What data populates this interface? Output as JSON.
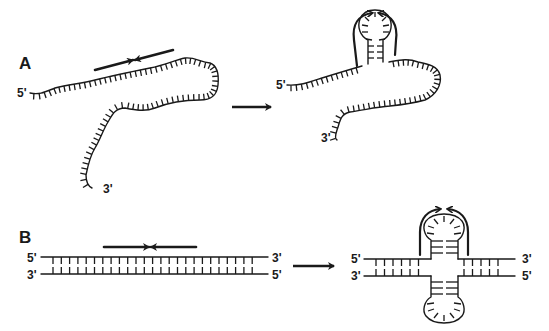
{
  "figure": {
    "panels": [
      {
        "id": "A",
        "label": "A",
        "description": "Single-stranded DNA forms a hairpin (stem-loop) where an inverted repeat is present",
        "before": {
          "end_5": "5'",
          "end_3": "3'",
          "inverted_repeat_arrows": "→←"
        },
        "after": {
          "end_5": "5'",
          "end_3": "3'",
          "structure": "hairpin"
        }
      },
      {
        "id": "B",
        "label": "B",
        "description": "Double-stranded DNA with an inverted repeat forms a cruciform structure",
        "before": {
          "top_left": "5'",
          "top_right": "3'",
          "bottom_left": "3'",
          "bottom_right": "5'",
          "inverted_repeat_arrows": "→←"
        },
        "after": {
          "top_left": "5'",
          "top_right": "3'",
          "bottom_left": "3'",
          "bottom_right": "5'",
          "structure": "cruciform"
        }
      }
    ],
    "transition_arrow": "→",
    "caption_fragment": "",
    "colors": {
      "ink": "#1a1a1a",
      "background": "#ffffff"
    }
  }
}
